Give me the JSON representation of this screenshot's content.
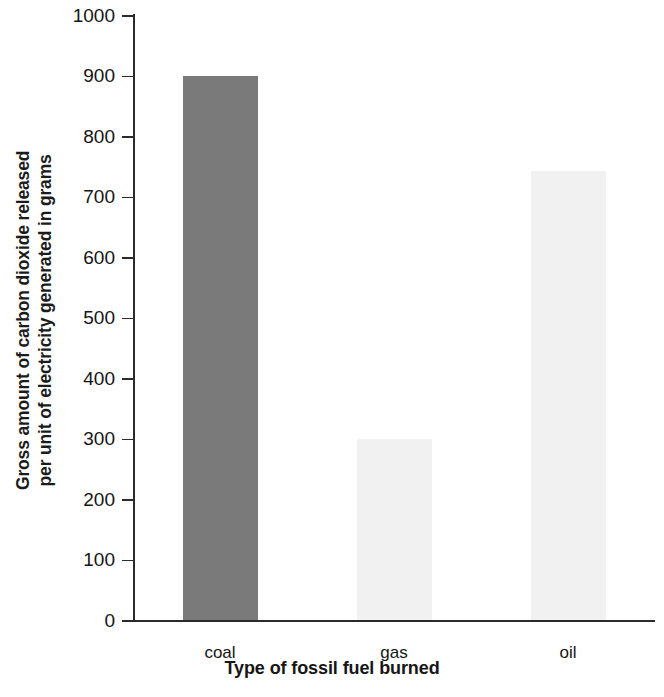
{
  "chart_data": {
    "type": "bar",
    "title": "",
    "xlabel": "Type of fossil fuel burned",
    "ylabel": "Gross amount of carbon dioxide released per unit of electricity generated in grams",
    "ylabel_lines": [
      "Gross amount of carbon dioxide released",
      "per unit of electricity generated in grams"
    ],
    "categories": [
      "coal",
      "gas",
      "oil"
    ],
    "values": [
      900,
      300,
      742
    ],
    "ylim": [
      0,
      1000
    ],
    "ytick_step": 100,
    "ytick_labels": [
      "0",
      "100",
      "200",
      "300",
      "400",
      "500",
      "600",
      "700",
      "800",
      "900",
      "1000"
    ],
    "ytick_values": [
      0,
      100,
      200,
      300,
      400,
      500,
      600,
      700,
      800,
      900,
      1000
    ],
    "grid": false,
    "legend": false,
    "bar_colors": [
      "#7a7a7a",
      "#f1f1f1",
      "#f1f1f1"
    ],
    "axis_color": "#2b2b2b",
    "background_color": "#ffffff",
    "bars": [
      {
        "category": "coal",
        "value": 900,
        "color": "#7a7a7a"
      },
      {
        "category": "gas",
        "value": 300,
        "color": "#f1f1f1"
      },
      {
        "category": "oil",
        "value": 742,
        "color": "#f1f1f1"
      }
    ]
  }
}
